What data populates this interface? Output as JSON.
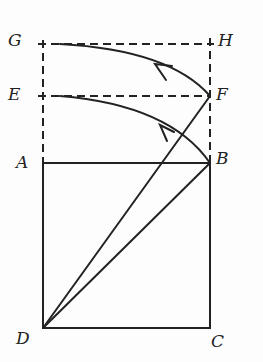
{
  "diagram": {
    "type": "geometric construction",
    "colors": {
      "ink": "#222222",
      "background": "#fdfdfd"
    },
    "points": {
      "G": [
        43,
        44
      ],
      "H": [
        210,
        44
      ],
      "E": [
        43,
        96
      ],
      "F": [
        210,
        96
      ],
      "A": [
        43,
        163
      ],
      "B": [
        210,
        163
      ],
      "D": [
        43,
        328
      ],
      "C": [
        210,
        328
      ]
    },
    "labels": [
      {
        "id": "G",
        "text": "G",
        "x": 8,
        "y": 32
      },
      {
        "id": "H",
        "text": "H",
        "x": 218,
        "y": 32
      },
      {
        "id": "E",
        "text": "E",
        "x": 8,
        "y": 86
      },
      {
        "id": "F",
        "text": "F",
        "x": 216,
        "y": 86
      },
      {
        "id": "A",
        "text": "A",
        "x": 16,
        "y": 154
      },
      {
        "id": "B",
        "text": "B",
        "x": 216,
        "y": 150
      },
      {
        "id": "D",
        "text": "D",
        "x": 16,
        "y": 330
      },
      {
        "id": "C",
        "text": "C",
        "x": 211,
        "y": 333
      }
    ],
    "solid_segments": [
      "AB",
      "BC",
      "CD",
      "DA",
      "DB",
      "DF"
    ],
    "dashed_segments": [
      "GH",
      "EF",
      "GA",
      "HB"
    ],
    "arcs": [
      {
        "from": "F",
        "to": "G",
        "arrow": true
      },
      {
        "from": "B",
        "to": "E",
        "arrow": true
      }
    ]
  }
}
